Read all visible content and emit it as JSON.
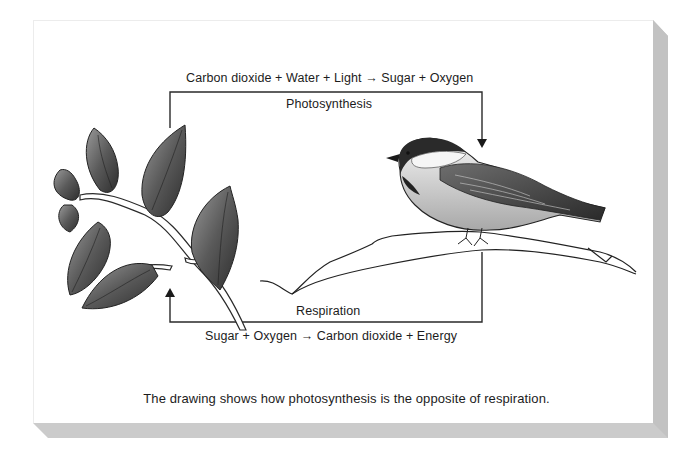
{
  "diagram": {
    "photosynthesis": {
      "label": "Photosynthesis",
      "equation": "Carbon dioxide + Water + Light → Sugar + Oxygen",
      "reactants": [
        "Carbon dioxide",
        "Water",
        "Light"
      ],
      "products": [
        "Sugar",
        "Oxygen"
      ],
      "direction": "plant-to-bird"
    },
    "respiration": {
      "label": "Respiration",
      "equation": "Sugar + Oxygen → Carbon dioxide + Energy",
      "reactants": [
        "Sugar",
        "Oxygen"
      ],
      "products": [
        "Carbon dioxide",
        "Energy"
      ],
      "direction": "bird-to-plant"
    },
    "illustrations": {
      "left": "leafy-branch",
      "right": "chickadee-on-branch"
    },
    "caption": "The drawing shows how photosynthesis is the opposite of respiration."
  },
  "colors": {
    "background": "#ffffff",
    "card": "#ffffff",
    "shadow": "#c8c8c8",
    "line": "#2a2a2a",
    "text": "#1c1c1c"
  }
}
